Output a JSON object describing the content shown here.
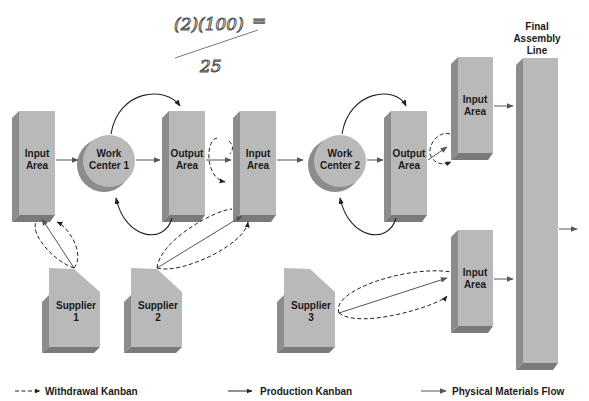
{
  "diagram": {
    "type": "kanban-flow",
    "handwritten_note": {
      "line1": "(2)(100)",
      "eq": "=",
      "line2": "25"
    },
    "nodes": {
      "input_area_1": {
        "label1": "Input",
        "label2": "Area"
      },
      "work_center_1": {
        "label1": "Work",
        "label2": "Center 1"
      },
      "output_area_1": {
        "label1": "Output",
        "label2": "Area"
      },
      "input_area_2": {
        "label1": "Input",
        "label2": "Area"
      },
      "work_center_2": {
        "label1": "Work",
        "label2": "Center 2"
      },
      "output_area_2": {
        "label1": "Output",
        "label2": "Area"
      },
      "input_area_3": {
        "label1": "Input",
        "label2": "Area"
      },
      "input_area_4": {
        "label1": "Input",
        "label2": "Area"
      },
      "final_assembly": {
        "label1": "Final",
        "label2": "Assembly",
        "label3": "Line"
      },
      "supplier_1": {
        "label1": "Supplier",
        "label2": "1"
      },
      "supplier_2": {
        "label1": "Supplier",
        "label2": "2"
      },
      "supplier_3": {
        "label1": "Supplier",
        "label2": "3"
      }
    },
    "legend": {
      "withdrawal": "Withdrawal Kanban",
      "production": "Production Kanban",
      "physical": "Physical Materials Flow"
    },
    "colors": {
      "box_face": "#b9b9b9",
      "box_side": "#8c8c8c",
      "box_bottom": "#7a7a7a",
      "arrow": "#555555",
      "kanban": "#222222"
    }
  }
}
